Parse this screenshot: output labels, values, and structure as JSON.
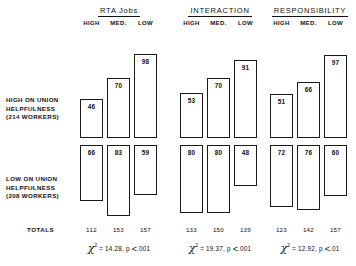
{
  "figure": {
    "row_labels": {
      "high": [
        "HIGH ON UNION",
        "HELPFULNESS",
        "(214 WORKERS)"
      ],
      "low": [
        "LOW ON UNION",
        "HELPFULNESS",
        "(208 WORKERS)"
      ]
    },
    "totals_label": "TOTALS",
    "column_headers": [
      "HIGH",
      "MED.",
      "LOW"
    ]
  },
  "chart_data": {
    "type": "bar",
    "title": "",
    "xlabel": "",
    "ylabel": "",
    "grid": false,
    "legend": "none",
    "layout": "three panels, mirrored bars: top row grows up from shared baseline, bottom row grows down from shared top line",
    "categories": [
      "HIGH",
      "MED.",
      "LOW"
    ],
    "panels": [
      {
        "title": "RTA Jobs",
        "series": [
          {
            "name": "HIGH ON UNION HELPFULNESS (214 WORKERS)",
            "direction": "up",
            "values": [
              46,
              70,
              98
            ]
          },
          {
            "name": "LOW ON UNION HELPFULNESS (208 WORKERS)",
            "direction": "down",
            "values": [
              66,
              83,
              59
            ]
          }
        ],
        "totals": [
          112,
          153,
          157
        ],
        "chi_square": "14.28",
        "p_value": ".001",
        "p_operator": "<"
      },
      {
        "title": "INTERACTION",
        "series": [
          {
            "name": "HIGH ON UNION HELPFULNESS (214 WORKERS)",
            "direction": "up",
            "values": [
              53,
              70,
              91
            ]
          },
          {
            "name": "LOW ON UNION HELPFULNESS (208 WORKERS)",
            "direction": "down",
            "values": [
              80,
              80,
              48
            ]
          }
        ],
        "totals": [
          133,
          150,
          139
        ],
        "chi_square": "19.37",
        "p_value": ".001",
        "p_operator": "<"
      },
      {
        "title": "RESPONSIBILITY",
        "series": [
          {
            "name": "HIGH ON UNION HELPFULNESS (214 WORKERS)",
            "direction": "up",
            "values": [
              51,
              66,
              97
            ]
          },
          {
            "name": "LOW ON UNION HELPFULNESS (208 WORKERS)",
            "direction": "down",
            "values": [
              72,
              76,
              60
            ]
          }
        ],
        "totals": [
          123,
          142,
          157
        ],
        "chi_square": "12.92",
        "p_value": ".01",
        "p_operator": "<"
      }
    ]
  }
}
